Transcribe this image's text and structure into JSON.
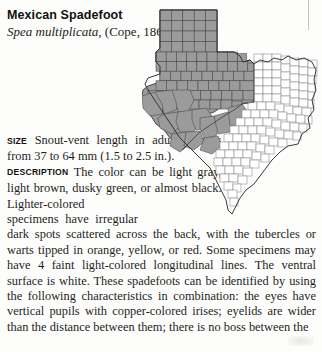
{
  "entry": {
    "common_name": "Mexican Spadefoot",
    "scientific_name": "Spea multiplicata",
    "authority": ", (Cope, 1863)"
  },
  "sections": [
    {
      "label": "SIZE",
      "text": "Snout-vent length in adults ranges from 37 to 64 mm (1.5 to 2.5 in.)."
    },
    {
      "label": "DESCRIPTION",
      "text": "The color can be light gray, light brown, dusky green, or almost black. Lighter-colored specimens have irregular dark spots scattered across the back, with the tubercles or warts tipped in orange, yellow, or red. Some specimens may have 4 faint light-colored longitudinal lines. The ventral surface is white. These spadefoots can be identified by using the following characteristics in combination: the eyes have vertical pupils with copper-colored irises; eyelids are wider than the distance between them; there is no boss between the"
    }
  ],
  "map": {
    "name": "texas-county-range-map",
    "region": "Texas",
    "shaded_meaning": "species range",
    "shaded_fill": "#9b9b9b",
    "unshaded_fill": "#ffffff",
    "border_color": "#2f2f2f",
    "shaded_area": "western and central-western Texas, including the Panhandle and Trans-Pecos"
  }
}
